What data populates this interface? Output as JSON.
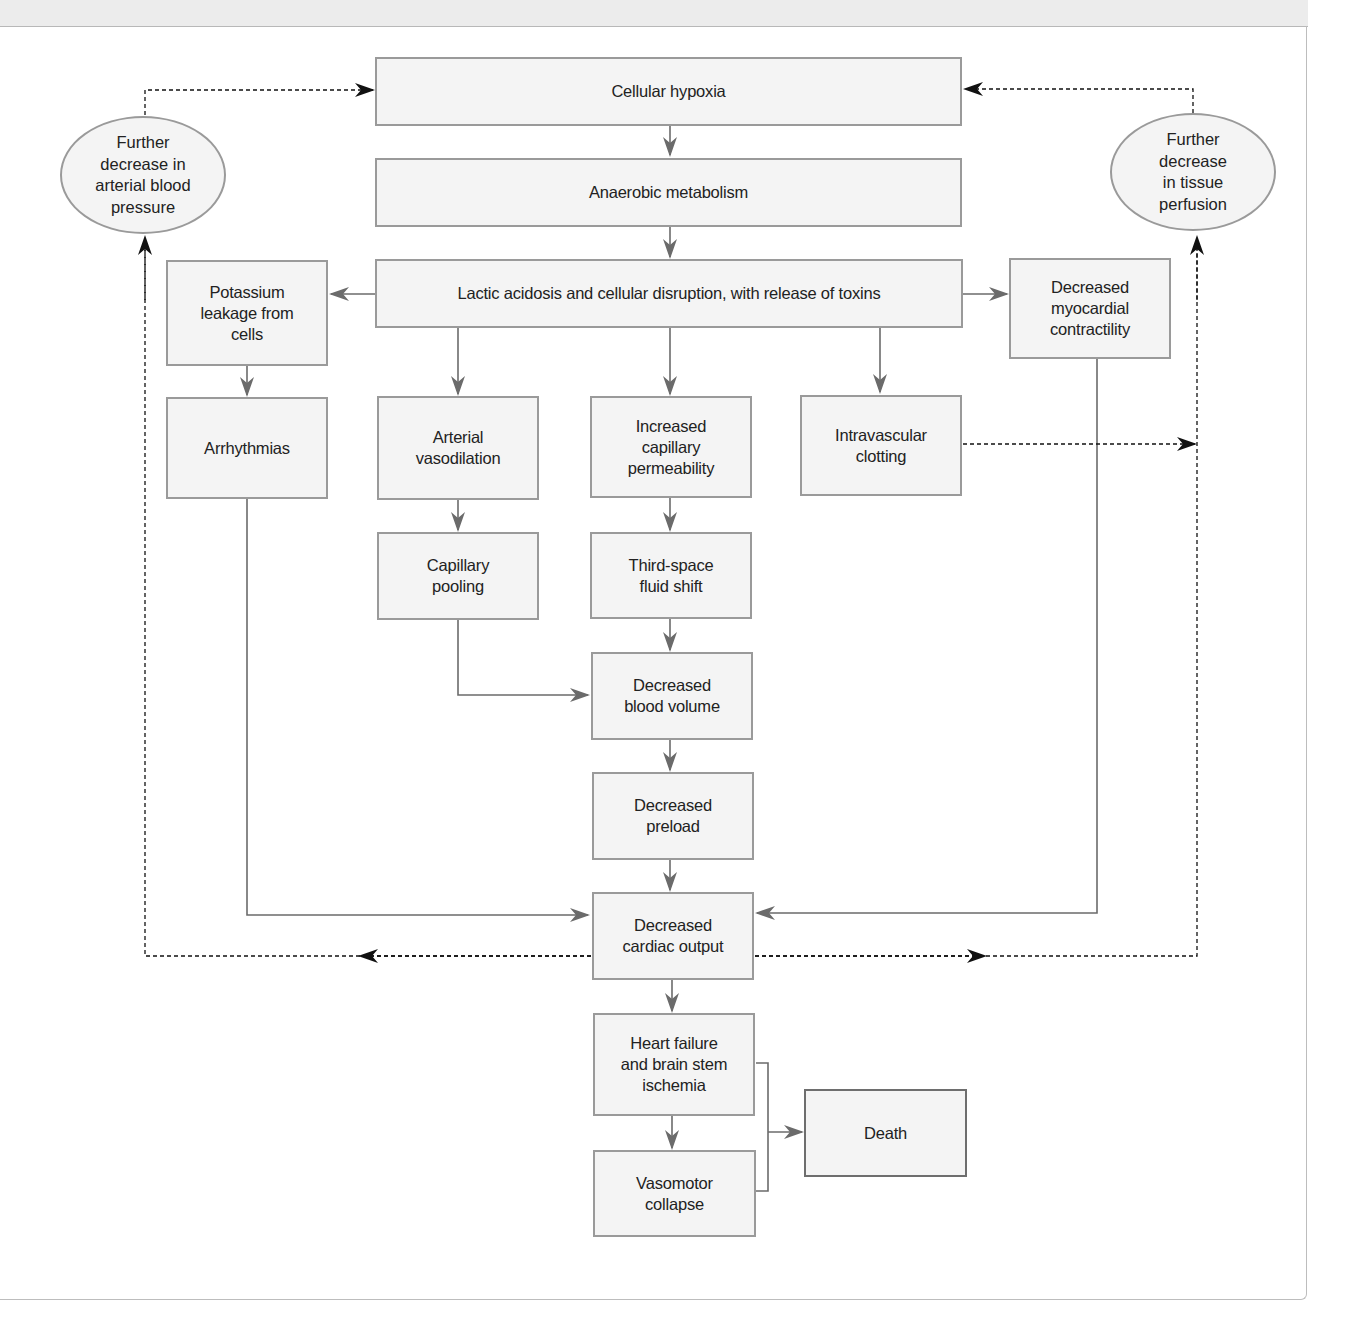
{
  "diagram": {
    "type": "flowchart",
    "colors": {
      "box_fill": "#f4f4f4",
      "box_border": "#9a9a9a",
      "terminal_border": "#6e6e6e",
      "solid_arrow": "#6b6b6b",
      "dashed_arrow": "#111111",
      "header_band": "#ececec"
    },
    "nodes": {
      "cellular_hypoxia": "Cellular hypoxia",
      "anaerobic_metabolism": "Anaerobic metabolism",
      "lactic_acidosis": "Lactic acidosis and cellular disruption, with release of toxins",
      "potassium_leakage": "Potassium\nleakage from\ncells",
      "arrhythmias": "Arrhythmias",
      "arterial_vasodilation": "Arterial\nvasodilation",
      "increased_capillary_permeability": "Increased\ncapillary\npermeability",
      "intravascular_clotting": "Intravascular\nclotting",
      "decreased_myocardial_contractility": "Decreased\nmyocardial\ncontractility",
      "capillary_pooling": "Capillary\npooling",
      "third_space_fluid_shift": "Third-space\nfluid shift",
      "decreased_blood_volume": "Decreased\nblood volume",
      "decreased_preload": "Decreased\npreload",
      "decreased_cardiac_output": "Decreased\ncardiac output",
      "heart_failure": "Heart failure\nand brain stem\nischemia",
      "vasomotor_collapse": "Vasomotor\ncollapse",
      "death": "Death",
      "further_decrease_bp": "Further\ndecrease in\narterial blood\npressure",
      "further_decrease_perfusion": "Further\ndecrease\nin tissue\nperfusion"
    },
    "edges": [
      {
        "from": "cellular_hypoxia",
        "to": "anaerobic_metabolism",
        "style": "solid"
      },
      {
        "from": "anaerobic_metabolism",
        "to": "lactic_acidosis",
        "style": "solid"
      },
      {
        "from": "lactic_acidosis",
        "to": "potassium_leakage",
        "style": "solid"
      },
      {
        "from": "lactic_acidosis",
        "to": "decreased_myocardial_contractility",
        "style": "solid"
      },
      {
        "from": "lactic_acidosis",
        "to": "arterial_vasodilation",
        "style": "solid"
      },
      {
        "from": "lactic_acidosis",
        "to": "increased_capillary_permeability",
        "style": "solid"
      },
      {
        "from": "lactic_acidosis",
        "to": "intravascular_clotting",
        "style": "solid"
      },
      {
        "from": "potassium_leakage",
        "to": "arrhythmias",
        "style": "solid"
      },
      {
        "from": "arterial_vasodilation",
        "to": "capillary_pooling",
        "style": "solid"
      },
      {
        "from": "increased_capillary_permeability",
        "to": "third_space_fluid_shift",
        "style": "solid"
      },
      {
        "from": "third_space_fluid_shift",
        "to": "decreased_blood_volume",
        "style": "solid"
      },
      {
        "from": "capillary_pooling",
        "to": "decreased_blood_volume",
        "style": "solid"
      },
      {
        "from": "decreased_blood_volume",
        "to": "decreased_preload",
        "style": "solid"
      },
      {
        "from": "decreased_preload",
        "to": "decreased_cardiac_output",
        "style": "solid"
      },
      {
        "from": "arrhythmias",
        "to": "decreased_cardiac_output",
        "style": "solid"
      },
      {
        "from": "decreased_myocardial_contractility",
        "to": "decreased_cardiac_output",
        "style": "solid"
      },
      {
        "from": "decreased_cardiac_output",
        "to": "heart_failure",
        "style": "solid"
      },
      {
        "from": "heart_failure",
        "to": "vasomotor_collapse",
        "style": "solid"
      },
      {
        "from": "heart_failure",
        "to": "death",
        "style": "solid"
      },
      {
        "from": "vasomotor_collapse",
        "to": "death",
        "style": "solid"
      },
      {
        "from": "decreased_cardiac_output",
        "to": "further_decrease_bp",
        "style": "dashed"
      },
      {
        "from": "decreased_cardiac_output",
        "to": "further_decrease_perfusion",
        "style": "dashed"
      },
      {
        "from": "intravascular_clotting",
        "to": "further_decrease_perfusion",
        "style": "dashed"
      },
      {
        "from": "further_decrease_bp",
        "to": "cellular_hypoxia",
        "style": "dashed"
      },
      {
        "from": "further_decrease_perfusion",
        "to": "cellular_hypoxia",
        "style": "dashed"
      }
    ]
  }
}
